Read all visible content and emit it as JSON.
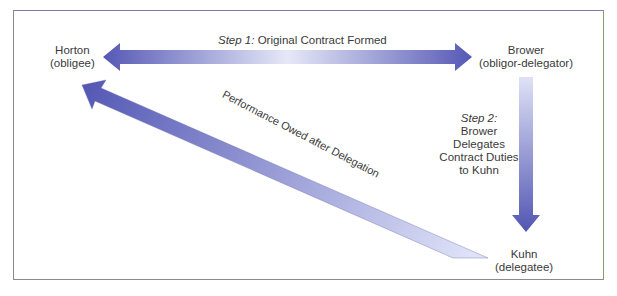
{
  "figure": {
    "type": "delegation-of-duties-diagram",
    "parties": {
      "horton": {
        "name": "Horton",
        "role": "(obligee)"
      },
      "brower": {
        "name": "Brower",
        "role": "(obligor-delegator)"
      },
      "kuhn": {
        "name": "Kuhn",
        "role": "(delegatee)"
      }
    },
    "step1": {
      "prefix": "Step 1:",
      "text": " Original Contract Formed"
    },
    "step2": {
      "prefix": "Step 2:",
      "lines": [
        "Brower",
        "Delegates",
        "Contract Duties",
        "to Kuhn"
      ]
    },
    "performance_label": "Performance Owed after Delegation",
    "colors": {
      "arrow_dark": "#5b5fb8",
      "arrow_light": "#dfe2f6",
      "text": "#3a3a3a",
      "frame": "#8a8a8a"
    }
  }
}
